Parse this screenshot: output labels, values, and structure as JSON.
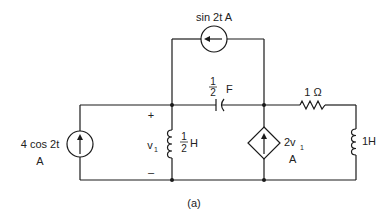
{
  "figure": {
    "caption": "(a)"
  },
  "components": {
    "independent_source_top": {
      "type": "current-source",
      "label": "sin 2t A",
      "direction": "left"
    },
    "independent_source_left": {
      "type": "current-source",
      "label_line1": "4 cos 2t",
      "label_line2": "A",
      "direction": "up"
    },
    "capacitor": {
      "type": "capacitor",
      "value_num": "1",
      "value_den": "2",
      "unit": "F"
    },
    "resistor": {
      "type": "resistor",
      "label": "1 Ω"
    },
    "inductor_left": {
      "type": "inductor",
      "value_num": "1",
      "value_den": "2",
      "unit": "H"
    },
    "inductor_right": {
      "type": "inductor",
      "label": "1H"
    },
    "dependent_source": {
      "type": "dependent-current-source",
      "label_coef": "2v",
      "label_sub": "1",
      "label_unit": "A",
      "direction": "up"
    },
    "voltage_v1": {
      "symbol": "v",
      "subscript": "1",
      "plus": "+",
      "minus": "–"
    }
  }
}
